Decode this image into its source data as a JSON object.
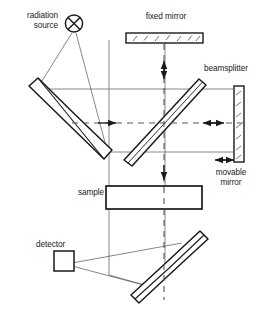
{
  "diagram": {
    "background_color": "#ffffff",
    "line_color": "#1a1a1a",
    "thin_line_color": "#55585c",
    "labels": {
      "radiation_source_line1": "radiation",
      "radiation_source_line2": "source",
      "fixed_mirror": "fixed  mirror",
      "beamsplitter": "beamsplitter",
      "movable_mirror_line1": "movable",
      "movable_mirror_line2": "mirror",
      "sample": "sample",
      "detector": "detector"
    },
    "components": [
      {
        "name": "radiation-source",
        "kind": "crossed-circle",
        "label": "radiation source",
        "cx": 74,
        "cy": 24,
        "r": 9
      },
      {
        "name": "collimating-mirror",
        "kind": "curved-mirror",
        "orientation": "tilted-45-left",
        "label": ""
      },
      {
        "name": "fixed-mirror",
        "kind": "hatched-bar",
        "orientation": "horizontal",
        "label": "fixed  mirror"
      },
      {
        "name": "beamsplitter",
        "kind": "tilted-plate",
        "orientation": "diagonal-45",
        "label": "beamsplitter"
      },
      {
        "name": "movable-mirror",
        "kind": "hatched-bar",
        "orientation": "vertical",
        "label": "movable mirror"
      },
      {
        "name": "sample",
        "kind": "rectangle",
        "label": "sample"
      },
      {
        "name": "focusing-mirror",
        "kind": "curved-mirror",
        "orientation": "tilted-45-right",
        "label": ""
      },
      {
        "name": "detector",
        "kind": "square-box",
        "label": "detector"
      }
    ],
    "beam_arrows": [
      {
        "name": "fixed-mirror-beam-arrow",
        "direction": "vertical-bidirectional"
      },
      {
        "name": "source-beam-arrow",
        "direction": "right"
      },
      {
        "name": "movable-mirror-beam-arrow",
        "direction": "horizontal-bidirectional"
      },
      {
        "name": "sample-beam-arrow",
        "direction": "down"
      },
      {
        "name": "mirror-travel-arrow",
        "direction": "horizontal-bidirectional"
      }
    ]
  }
}
